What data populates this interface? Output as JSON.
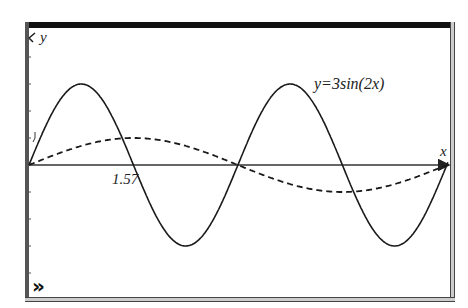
{
  "chart_data": {
    "type": "line",
    "title": "",
    "xlabel": "x",
    "ylabel": "y",
    "xlim": [
      0,
      6.3
    ],
    "ylim": [
      -3.0,
      5.1
    ],
    "grid": false,
    "x_tick_labels": [
      "1.57"
    ],
    "y_tick_labels": [
      "1"
    ],
    "series": [
      {
        "name": "y=3sin(2x)",
        "style": "solid",
        "function": "3*sin(2*x)",
        "x": [
          0,
          0.785,
          1.571,
          2.356,
          3.142,
          3.927,
          4.712,
          5.498,
          6.283
        ],
        "values": [
          0,
          3,
          0,
          -3,
          0,
          3,
          0,
          -3,
          0
        ]
      },
      {
        "name": "y=sin(x)",
        "style": "dashed",
        "function": "sin(x)",
        "x": [
          0,
          1.571,
          3.142,
          4.712,
          6.283
        ],
        "values": [
          0,
          1,
          0,
          -1,
          0
        ]
      }
    ],
    "annotations": [
      "y=3sin(2x)",
      "1.57"
    ]
  },
  "labels": {
    "y_axis": "y",
    "x_axis": "x",
    "x_tick": "1.57",
    "curve": "y=3sin(2x)",
    "expand_icon": "»"
  },
  "colors": {
    "curve": "#1a1a1a",
    "axis": "#333333",
    "frame_top": "#111111"
  }
}
